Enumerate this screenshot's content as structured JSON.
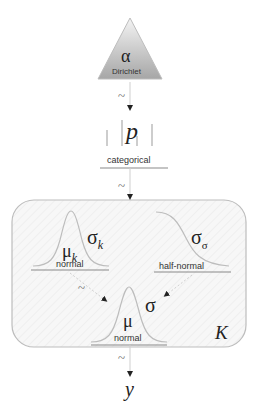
{
  "diagram": {
    "nodes": {
      "alpha": {
        "symbol": "α",
        "distribution": "Dirichlet"
      },
      "p": {
        "symbol": "p",
        "distribution": "categorical"
      },
      "mu_k": {
        "symbol": "μ",
        "subscript": "k",
        "distribution": "normal"
      },
      "sigma_k": {
        "symbol": "σ",
        "subscript": "k"
      },
      "sigma_sigma": {
        "symbol": "σ",
        "subscript": "σ",
        "distribution": "half-normal"
      },
      "mu": {
        "symbol": "μ",
        "distribution": "normal"
      },
      "sigma": {
        "symbol": "σ"
      },
      "y": {
        "symbol": "y"
      }
    },
    "plate": {
      "label": "K"
    },
    "edges": [
      {
        "from": "alpha",
        "to": "p",
        "label": "~"
      },
      {
        "from": "p",
        "to": "plate",
        "label": "~"
      },
      {
        "from": "mu_k",
        "to": "mu",
        "label": "~"
      },
      {
        "from": "sigma_sigma",
        "to": "sigma",
        "label": ""
      },
      {
        "from": "mu",
        "to": "y",
        "label": "~"
      }
    ],
    "colors": {
      "triangle_fill_top": "#f2f2f2",
      "triangle_fill_bottom": "#a8a8a8",
      "stroke": "#8a8a8a",
      "plate_fill": "#f6f6f6",
      "plate_border": "#bdbdbd",
      "arrow": "#222222"
    }
  }
}
